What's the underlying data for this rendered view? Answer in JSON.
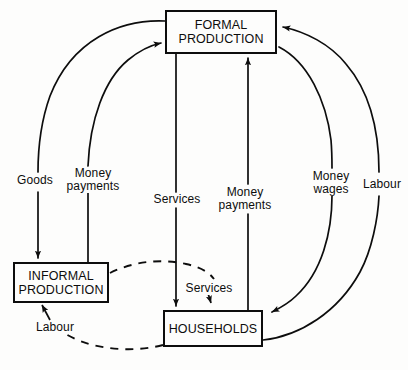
{
  "diagram": {
    "background_color": "#fdfdfc",
    "line_color": "#0d0d0d",
    "nodes": [
      {
        "id": "formal",
        "lines": [
          "FORMAL",
          "PRODUCTION"
        ]
      },
      {
        "id": "informal",
        "lines": [
          "INFORMAL",
          "PRODUCTION"
        ]
      },
      {
        "id": "households",
        "lines": [
          "HOUSEHOLDS"
        ]
      }
    ],
    "edge_labels": {
      "goods": {
        "lines": [
          "Goods"
        ]
      },
      "money_payments_informal": {
        "lines": [
          "Money",
          "payments"
        ]
      },
      "services_formal": {
        "lines": [
          "Services"
        ]
      },
      "money_payments_households": {
        "lines": [
          "Money",
          "payments"
        ]
      },
      "money_wages": {
        "lines": [
          "Money",
          "wages"
        ]
      },
      "labour_formal": {
        "lines": [
          "Labour"
        ]
      },
      "services_informal": {
        "lines": [
          "Services"
        ]
      },
      "labour_informal": {
        "lines": [
          "Labour"
        ]
      }
    },
    "edges": [
      {
        "id": "goods",
        "from": "formal",
        "to": "informal",
        "label": "Goods",
        "style": "solid"
      },
      {
        "id": "money-payments-informal",
        "from": "informal",
        "to": "formal",
        "label": "Money payments",
        "style": "solid"
      },
      {
        "id": "services-formal",
        "from": "formal",
        "to": "households",
        "label": "Services",
        "style": "solid"
      },
      {
        "id": "money-payments-households",
        "from": "households",
        "to": "formal",
        "label": "Money payments",
        "style": "solid"
      },
      {
        "id": "money-wages",
        "from": "formal",
        "to": "households",
        "label": "Money wages",
        "style": "solid"
      },
      {
        "id": "labour-formal",
        "from": "households",
        "to": "formal",
        "label": "Labour",
        "style": "solid"
      },
      {
        "id": "services-informal",
        "from": "informal",
        "to": "households",
        "label": "Services",
        "style": "dashed"
      },
      {
        "id": "labour-informal",
        "from": "households",
        "to": "informal",
        "label": "Labour",
        "style": "dashed"
      }
    ]
  }
}
